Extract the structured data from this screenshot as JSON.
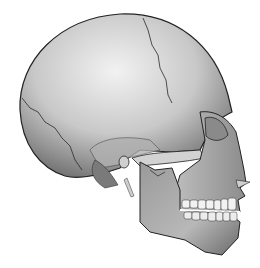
{
  "image": {
    "subject": "Human skull, lateral (side) view, 3D grayscale rendering",
    "facing": "right",
    "background_color": "#ffffff",
    "colors": {
      "bone_light": "#e6e6e6",
      "bone_mid": "#a8a8a8",
      "bone_dark": "#5a5a5a",
      "suture_line": "#2a2a2a",
      "teeth": "#f2f2f2"
    },
    "parts": [
      "cranium",
      "coronal-suture",
      "lambdoid-suture",
      "zygomatic-arch",
      "orbit",
      "nasal-bone",
      "maxilla",
      "mandible",
      "teeth",
      "mastoid-process",
      "styloid-process"
    ]
  }
}
